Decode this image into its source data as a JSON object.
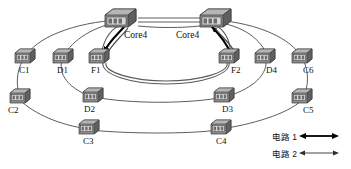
{
  "diagram": {
    "background_color": "#ffffff",
    "line_color": "#4a4a4a",
    "circuit1_color": "#000000",
    "circuit2_color": "#3f3f3f"
  },
  "core_nodes": [
    {
      "id": "core-left",
      "label": "Core4",
      "x": 120,
      "y": 18,
      "label_x": 124,
      "label_y": 36
    },
    {
      "id": "core-right",
      "label": "Core4",
      "x": 215,
      "y": 18,
      "label_x": 176,
      "label_y": 36
    }
  ],
  "nodes": [
    {
      "id": "c1",
      "label": "C1",
      "x": 25,
      "y": 56,
      "label_x": 19,
      "label_y": 71
    },
    {
      "id": "d1",
      "label": "D1",
      "x": 63,
      "y": 56,
      "label_x": 59,
      "label_y": 71
    },
    {
      "id": "f1",
      "label": "F1",
      "x": 99,
      "y": 56,
      "label_x": 93,
      "label_y": 71
    },
    {
      "id": "f2",
      "label": "F2",
      "x": 228,
      "y": 56,
      "label_x": 231,
      "label_y": 71
    },
    {
      "id": "d4",
      "label": "D4",
      "x": 263,
      "y": 56,
      "label_x": 266,
      "label_y": 71
    },
    {
      "id": "c6",
      "label": "C6",
      "x": 300,
      "y": 56,
      "label_x": 303,
      "label_y": 71
    },
    {
      "id": "c2",
      "label": "C2",
      "x": 19,
      "y": 96,
      "label_x": 14,
      "label_y": 112
    },
    {
      "id": "d2",
      "label": "D2",
      "x": 92,
      "y": 95,
      "label_x": 90,
      "label_y": 111
    },
    {
      "id": "d3",
      "label": "D3",
      "x": 223,
      "y": 95,
      "label_x": 228,
      "label_y": 111
    },
    {
      "id": "c5",
      "label": "C5",
      "x": 300,
      "y": 96,
      "label_x": 305,
      "label_y": 112
    },
    {
      "id": "c3",
      "label": "C3",
      "x": 87,
      "y": 127,
      "label_x": 88,
      "label_y": 143
    },
    {
      "id": "c4",
      "label": "C4",
      "x": 219,
      "y": 127,
      "label_x": 222,
      "label_y": 143
    }
  ],
  "legend": {
    "items": [
      {
        "id": "circuit-1",
        "label": "电路 1",
        "style": "thick",
        "arrow": "double-headed"
      },
      {
        "id": "circuit-2",
        "label": "电路 2",
        "style": "thin",
        "arrow": "double-headed"
      }
    ]
  },
  "rings": [
    {
      "id": "outer-ring",
      "description": "C1-C2-C3-C4-C5-C6 outer ring through both Core4 nodes"
    },
    {
      "id": "middle-ring",
      "description": "D1-D2-D3-D4 middle ring through both Core4 nodes"
    },
    {
      "id": "inner-ring",
      "description": "F1-F2 inner ring through both Core4 nodes"
    }
  ]
}
